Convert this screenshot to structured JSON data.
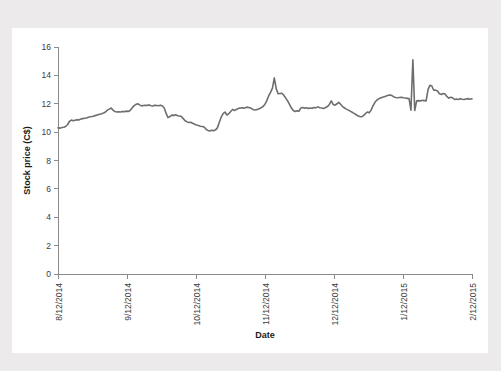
{
  "figure": {
    "background_color": "#ffffff",
    "page_background_color": "#eceaea"
  },
  "chart_data": {
    "type": "line",
    "title": "",
    "subtitle": "",
    "xlabel": "Date",
    "ylabel": "Stock price (C$)",
    "ylim": [
      0,
      16
    ],
    "yticks": [
      0,
      2,
      4,
      6,
      8,
      10,
      12,
      14,
      16
    ],
    "ytick_labels": [
      "0",
      "2",
      "4",
      "6",
      "8",
      "10",
      "12",
      "14",
      "16"
    ],
    "xtick_labels": [
      "8/12/2014",
      "9/12/2014",
      "10/12/2014",
      "11/12/2014",
      "12/12/2014",
      "1/12/2015",
      "2/12/2015"
    ],
    "xtick_positions": [
      0,
      1,
      2,
      3,
      4,
      5,
      6
    ],
    "xlim": [
      0,
      6
    ],
    "grid": false,
    "legend": null,
    "legend_position": "none",
    "line_color": "#6e6e6e",
    "axis_color": "#8a8a8a",
    "series": [
      {
        "name": "Stock price (C$)",
        "units": "C$",
        "x": [
          0.0,
          0.028,
          0.055,
          0.083,
          0.11,
          0.138,
          0.165,
          0.193,
          0.22,
          0.248,
          0.275,
          0.303,
          0.33,
          0.358,
          0.385,
          0.413,
          0.44,
          0.468,
          0.495,
          0.523,
          0.55,
          0.578,
          0.605,
          0.633,
          0.66,
          0.688,
          0.715,
          0.743,
          0.77,
          0.798,
          0.825,
          0.853,
          0.88,
          0.908,
          0.935,
          0.963,
          0.99,
          1.018,
          1.045,
          1.073,
          1.1,
          1.128,
          1.155,
          1.183,
          1.21,
          1.238,
          1.265,
          1.293,
          1.32,
          1.348,
          1.375,
          1.403,
          1.43,
          1.458,
          1.485,
          1.513,
          1.54,
          1.568,
          1.595,
          1.623,
          1.65,
          1.678,
          1.705,
          1.733,
          1.76,
          1.788,
          1.815,
          1.843,
          1.87,
          1.898,
          1.925,
          1.953,
          1.98,
          2.008,
          2.035,
          2.063,
          2.09,
          2.118,
          2.145,
          2.173,
          2.2,
          2.228,
          2.255,
          2.283,
          2.31,
          2.338,
          2.365,
          2.393,
          2.42,
          2.448,
          2.475,
          2.503,
          2.53,
          2.558,
          2.585,
          2.613,
          2.64,
          2.668,
          2.695,
          2.723,
          2.75,
          2.778,
          2.805,
          2.833,
          2.86,
          2.888,
          2.915,
          2.943,
          2.97,
          2.998,
          3.025,
          3.053,
          3.08,
          3.108,
          3.135,
          3.163,
          3.19,
          3.218,
          3.245,
          3.273,
          3.3,
          3.328,
          3.355,
          3.383,
          3.41,
          3.438,
          3.465,
          3.493,
          3.52,
          3.548,
          3.575,
          3.603,
          3.63,
          3.658,
          3.685,
          3.713,
          3.74,
          3.768,
          3.795,
          3.823,
          3.85,
          3.878,
          3.905,
          3.933,
          3.96,
          3.988,
          4.015,
          4.043,
          4.07,
          4.098,
          4.125,
          4.153,
          4.18,
          4.208,
          4.235,
          4.263,
          4.29,
          4.318,
          4.345,
          4.373,
          4.4,
          4.428,
          4.455,
          4.483,
          4.51,
          4.538,
          4.565,
          4.593,
          4.62,
          4.648,
          4.675,
          4.703,
          4.73,
          4.758,
          4.785,
          4.813,
          4.84,
          4.868,
          4.895,
          4.923,
          4.95,
          4.978,
          5.005,
          5.033,
          5.06,
          5.088,
          5.115,
          5.143,
          5.17,
          5.198,
          5.225,
          5.253,
          5.28,
          5.308,
          5.335,
          5.363,
          5.39,
          5.418,
          5.445,
          5.473,
          5.5,
          5.528,
          5.555,
          5.583,
          5.61,
          5.638,
          5.665,
          5.693,
          5.72,
          5.748,
          5.775,
          5.803,
          5.83,
          5.858,
          5.885,
          5.913,
          5.94,
          5.968,
          6.0
        ],
        "values": [
          10.3,
          10.28,
          10.32,
          10.35,
          10.4,
          10.52,
          10.75,
          10.85,
          10.8,
          10.84,
          10.88,
          10.86,
          10.92,
          10.95,
          10.98,
          11.0,
          11.05,
          11.08,
          11.1,
          11.14,
          11.18,
          11.22,
          11.26,
          11.3,
          11.35,
          11.42,
          11.55,
          11.62,
          11.7,
          11.55,
          11.45,
          11.42,
          11.44,
          11.42,
          11.46,
          11.44,
          11.48,
          11.46,
          11.52,
          11.7,
          11.85,
          11.95,
          12.0,
          11.92,
          11.85,
          11.88,
          11.9,
          11.88,
          11.92,
          11.86,
          11.84,
          11.9,
          11.88,
          11.86,
          11.9,
          11.84,
          11.7,
          11.3,
          11.02,
          11.1,
          11.2,
          11.18,
          11.22,
          11.16,
          11.14,
          11.1,
          10.95,
          10.8,
          10.72,
          10.68,
          10.7,
          10.62,
          10.55,
          10.5,
          10.46,
          10.42,
          10.4,
          10.36,
          10.2,
          10.12,
          10.08,
          10.14,
          10.1,
          10.16,
          10.3,
          10.7,
          11.05,
          11.3,
          11.42,
          11.2,
          11.3,
          11.45,
          11.6,
          11.52,
          11.6,
          11.66,
          11.7,
          11.72,
          11.68,
          11.74,
          11.76,
          11.72,
          11.66,
          11.58,
          11.56,
          11.6,
          11.64,
          11.72,
          11.8,
          11.95,
          12.2,
          12.55,
          12.8,
          13.1,
          13.82,
          13.05,
          12.7,
          12.72,
          12.74,
          12.6,
          12.4,
          12.2,
          11.95,
          11.7,
          11.52,
          11.45,
          11.5,
          11.48,
          11.7,
          11.74,
          11.68,
          11.72,
          11.66,
          11.7,
          11.68,
          11.74,
          11.72,
          11.78,
          11.72,
          11.7,
          11.66,
          11.74,
          11.8,
          11.95,
          12.2,
          11.95,
          11.9,
          12.0,
          12.1,
          11.95,
          11.8,
          11.7,
          11.62,
          11.55,
          11.48,
          11.4,
          11.32,
          11.24,
          11.15,
          11.1,
          11.08,
          11.16,
          11.3,
          11.42,
          11.36,
          11.55,
          11.85,
          12.1,
          12.25,
          12.35,
          12.4,
          12.45,
          12.5,
          12.55,
          12.6,
          12.62,
          12.58,
          12.48,
          12.44,
          12.42,
          12.44,
          12.46,
          12.42,
          12.4,
          12.38,
          12.36,
          11.55,
          15.1,
          11.52,
          12.2,
          12.22,
          12.2,
          12.24,
          12.22,
          12.2,
          13.0,
          13.3,
          13.25,
          12.95,
          12.96,
          12.9,
          12.7,
          12.65,
          12.72,
          12.68,
          12.5,
          12.4,
          12.45,
          12.42,
          12.3,
          12.34,
          12.3,
          12.36,
          12.32,
          12.3,
          12.34,
          12.36,
          12.32,
          12.35
        ]
      }
    ]
  }
}
